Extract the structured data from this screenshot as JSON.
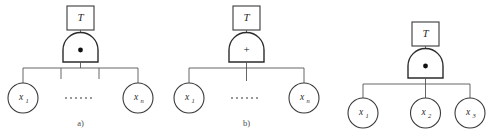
{
  "figure": {
    "background_color": "#ffffff",
    "line_color": "#3a3a3a",
    "text_color": "#2a2a2a"
  },
  "diagrams": [
    {
      "id": "diagram-a",
      "caption": "a)",
      "top_event": {
        "label": "T",
        "shape": "rectangle"
      },
      "gate": {
        "type": "AND",
        "symbol": "•",
        "shape": "dome"
      },
      "children": [
        {
          "label": "x",
          "sub": "1",
          "shape": "circle"
        },
        {
          "label": "x",
          "sub": "n",
          "shape": "circle"
        }
      ],
      "ellipsis": "······",
      "ellipsis_dots": 6,
      "stub_count": 2
    },
    {
      "id": "diagram-b",
      "caption": "b)",
      "top_event": {
        "label": "T",
        "shape": "rectangle"
      },
      "gate": {
        "type": "OR",
        "symbol": "+",
        "shape": "dome"
      },
      "children": [
        {
          "label": "x",
          "sub": "1",
          "shape": "circle"
        },
        {
          "label": "x",
          "sub": "n",
          "shape": "circle"
        }
      ],
      "ellipsis": "······",
      "ellipsis_dots": 6,
      "stub_count": 1
    },
    {
      "id": "diagram-c",
      "caption": "",
      "top_event": {
        "label": "T",
        "shape": "rectangle"
      },
      "gate": {
        "type": "AND",
        "symbol": "•",
        "shape": "dome"
      },
      "children": [
        {
          "label": "x",
          "sub": "1",
          "shape": "circle"
        },
        {
          "label": "x",
          "sub": "2",
          "shape": "circle"
        },
        {
          "label": "x",
          "sub": "3",
          "shape": "circle"
        }
      ],
      "ellipsis": "",
      "ellipsis_dots": 0,
      "stub_count": 0
    }
  ]
}
